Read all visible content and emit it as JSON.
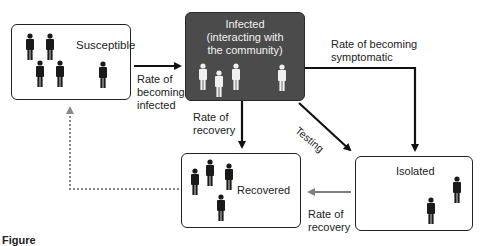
{
  "diagram": {
    "nodes": {
      "susceptible": {
        "label": "Susceptible",
        "people": 5
      },
      "infected": {
        "label_lines": [
          "Infected",
          "(interacting with",
          "the community)"
        ],
        "people": 4
      },
      "recovered": {
        "label": "Recovered",
        "people": 4
      },
      "isolated": {
        "label": "Isolated",
        "people": 2
      }
    },
    "edges": {
      "s_to_i": {
        "label_lines": [
          "Rate of",
          "becoming",
          "infected"
        ]
      },
      "i_to_isolated_symptomatic": {
        "label_lines": [
          "Rate of becoming",
          "symptomatic"
        ]
      },
      "i_to_recovered": {
        "label_lines": [
          "Rate of",
          "recovery"
        ]
      },
      "i_to_isolated_testing": {
        "label": "Testing"
      },
      "isolated_to_recovered": {
        "label_lines": [
          "Rate of",
          "recovery"
        ]
      },
      "recovered_to_susceptible": {
        "label": "",
        "style": "dotted"
      }
    },
    "caption": "Figure"
  },
  "colors": {
    "infected_fill": "#4b4b4b",
    "person_dark": "#1a1a1a",
    "person_light": "#f0f0f0",
    "arrow_black": "#111111",
    "arrow_gray": "#808080",
    "dotted_gray": "#8a8a8a"
  }
}
